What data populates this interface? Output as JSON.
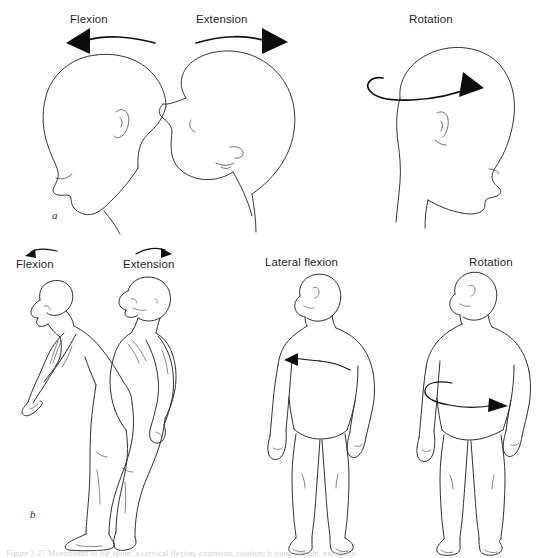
{
  "figure": {
    "background_color": "#ffffff",
    "ink_color": "#2b2b2b",
    "arrow_color": "#0d0d0d",
    "panels": [
      {
        "id": "a",
        "id_label": "a",
        "subject": "cervical-spine-movements",
        "labels": [
          {
            "name": "flexion",
            "text": "Flexion"
          },
          {
            "name": "extension",
            "text": "Extension"
          },
          {
            "name": "rotation",
            "text": "Rotation"
          }
        ]
      },
      {
        "id": "b",
        "id_label": "b",
        "subject": "trunk-movements",
        "labels": [
          {
            "name": "flexion",
            "text": "Flexion"
          },
          {
            "name": "extension",
            "text": "Extension"
          },
          {
            "name": "lateral-flexion",
            "text": "Lateral flexion"
          },
          {
            "name": "rotation",
            "text": "Rotation"
          }
        ]
      }
    ],
    "caption": "Figure 3.27   Movements of the spine:  a  cervical flexion, extension, rotation;  b  trunk flexion, extension"
  },
  "panel_a": {
    "label_flexion": "Flexion",
    "label_extension": "Extension",
    "label_rotation": "Rotation",
    "panel_id": "a"
  },
  "panel_b": {
    "label_flexion": "Flexion",
    "label_extension": "Extension",
    "label_lateral_flexion": "Lateral flexion",
    "label_rotation": "Rotation",
    "panel_id": "b"
  },
  "caption_text": "Figure 3.27   Movements of the spine:  a  cervical flexion, extension, rotation;  b  trunk flexion, extension"
}
